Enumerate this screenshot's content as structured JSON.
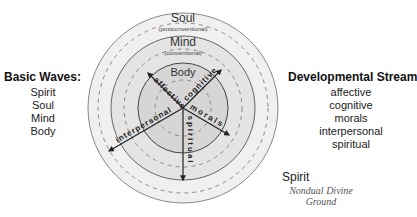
{
  "left_legend": {
    "title": "Basic Waves:",
    "items": [
      "Spirit",
      "Soul",
      "Mind",
      "Body"
    ]
  },
  "right_legend": {
    "title": "Developmental Streams:",
    "items": [
      "affective",
      "cognitive",
      "morals",
      "interpersonal",
      "spiritual"
    ]
  },
  "diagram": {
    "rings": [
      {
        "label": "Soul",
        "sublabel": "(postconventional)"
      },
      {
        "label": "Mind",
        "sublabel": "(conventional)"
      },
      {
        "label": "Body",
        "sublabel": ""
      }
    ],
    "streams": [
      "affective",
      "cognitive",
      "morals",
      "interpersonal",
      "spiritual"
    ],
    "spirit": {
      "label": "Spirit",
      "sublabel_line1": "Nondual Divine",
      "sublabel_line2": "Ground"
    },
    "colors": {
      "outer_band": "#ececec",
      "soul_band": "#e2e2e2",
      "mind_band": "#d6d6d6",
      "body_fill": "#cfcfcf",
      "stroke": "#555555",
      "dash": "#8a8a8a"
    }
  }
}
